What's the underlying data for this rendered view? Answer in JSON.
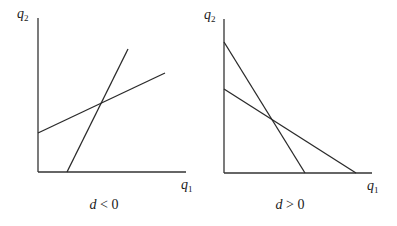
{
  "diagram": {
    "type": "reaction-function-comparison",
    "panels": [
      {
        "id": "left",
        "caption": {
          "variable": "d",
          "relation": " < 0"
        },
        "axes": {
          "y_label": {
            "base": "q",
            "sub": "2"
          },
          "x_label": {
            "base": "q",
            "sub": "1"
          },
          "origin": [
            38,
            172
          ],
          "y_top": [
            38,
            18
          ],
          "x_right": [
            186,
            172
          ]
        },
        "lines": [
          {
            "name": "steep-upward-line",
            "from": [
              67,
              172
            ],
            "to": [
              128,
              49
            ]
          },
          {
            "name": "shallow-upward-line",
            "from": [
              38,
              133
            ],
            "to": [
              165,
              73
            ]
          }
        ],
        "note": "Both lines slope upward; intersection near (100, 104)"
      },
      {
        "id": "right",
        "caption": {
          "variable": "d",
          "relation": " > 0"
        },
        "axes": {
          "y_label": {
            "base": "q",
            "sub": "2"
          },
          "x_label": {
            "base": "q",
            "sub": "1"
          },
          "origin": [
            224,
            173
          ],
          "y_top": [
            224,
            19
          ],
          "x_right": [
            372,
            173
          ]
        },
        "lines": [
          {
            "name": "steep-downward-line",
            "from": [
              224,
              42
            ],
            "to": [
              305,
              173
            ]
          },
          {
            "name": "shallow-downward-line",
            "from": [
              224,
              89
            ],
            "to": [
              356,
              173
            ]
          }
        ],
        "note": "Both lines slope downward; intersection near (271, 119)"
      }
    ]
  },
  "colors": {
    "background": "#ffffff",
    "axis": "#333333",
    "line": "#2a2a2a",
    "text": "#1a1a1a"
  }
}
